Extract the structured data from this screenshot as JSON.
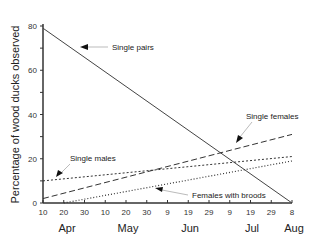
{
  "chart_data": {
    "type": "line",
    "title": "",
    "xlabel": "",
    "ylabel": "Percentage of wood ducks observed",
    "ylim": [
      0,
      80
    ],
    "yticks": [
      0,
      20,
      40,
      60,
      80
    ],
    "x_tick_labels": [
      "10",
      "20",
      "30",
      "10",
      "20",
      "30",
      "9",
      "19",
      "29",
      "9",
      "19",
      "29",
      "8"
    ],
    "x_month_labels": [
      "Apr",
      "May",
      "Jun",
      "Jul",
      "Aug"
    ],
    "x": [
      "Apr 10",
      "Aug 8"
    ],
    "series": [
      {
        "name": "Single pairs",
        "style": "solid",
        "values": [
          79,
          0
        ]
      },
      {
        "name": "Single females",
        "style": "dashed",
        "values": [
          2,
          31
        ]
      },
      {
        "name": "Single males",
        "style": "dotted",
        "values": [
          10,
          21
        ]
      },
      {
        "name": "Females with broods",
        "style": "dotted-fine",
        "start": "Apr 20",
        "values": [
          0,
          19
        ]
      }
    ],
    "grid": false,
    "legend": "inline annotations with arrows"
  }
}
